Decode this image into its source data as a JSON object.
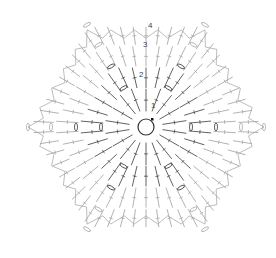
{
  "diagram": {
    "type": "crochet-chart",
    "shape": "hexagon",
    "center": [
      146,
      127
    ],
    "round_labels": [
      "1",
      "2",
      "3",
      "4"
    ],
    "colors": {
      "background": "#ffffff",
      "stitch_light": "#9a9a9a",
      "stitch_dark": "#333333",
      "marker": "#111111"
    }
  }
}
